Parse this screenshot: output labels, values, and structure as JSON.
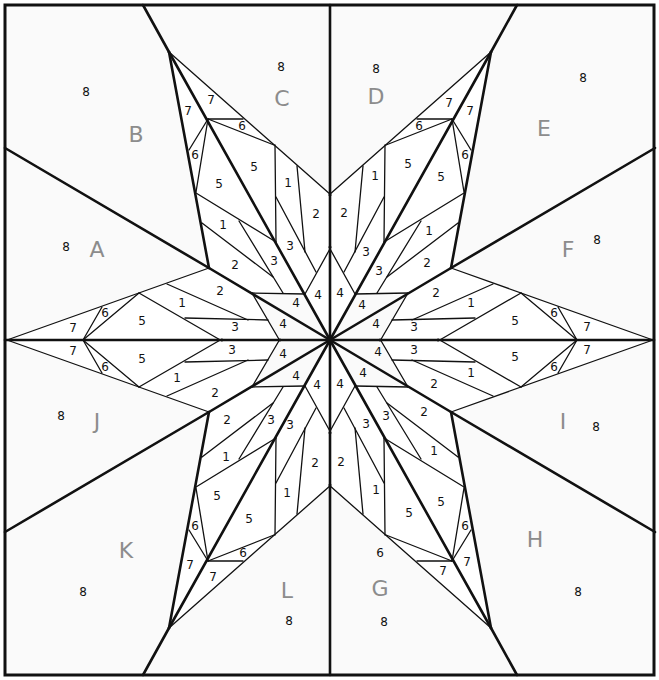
{
  "diagram": {
    "size": {
      "width": 659,
      "height": 680
    },
    "center": [
      330,
      340
    ],
    "colors": {
      "background": "#fafafa",
      "piece": "#ffffff",
      "line": "#111111",
      "section_letter": "#8c8c8c"
    },
    "section_letters": [
      {
        "text": "A",
        "x": 97,
        "y": 249
      },
      {
        "text": "B",
        "x": 136,
        "y": 134
      },
      {
        "text": "C",
        "x": 282,
        "y": 98
      },
      {
        "text": "D",
        "x": 376,
        "y": 96
      },
      {
        "text": "E",
        "x": 544,
        "y": 128
      },
      {
        "text": "F",
        "x": 568,
        "y": 249
      },
      {
        "text": "I",
        "x": 563,
        "y": 421
      },
      {
        "text": "H",
        "x": 535,
        "y": 539
      },
      {
        "text": "G",
        "x": 380,
        "y": 588
      },
      {
        "text": "L",
        "x": 287,
        "y": 590
      },
      {
        "text": "K",
        "x": 126,
        "y": 550
      },
      {
        "text": "J",
        "x": 97,
        "y": 421
      }
    ],
    "piece_numbers": [
      {
        "text": "8",
        "x": 86,
        "y": 92
      },
      {
        "text": "8",
        "x": 281,
        "y": 67
      },
      {
        "text": "8",
        "x": 376,
        "y": 69
      },
      {
        "text": "8",
        "x": 583,
        "y": 78
      },
      {
        "text": "8",
        "x": 66,
        "y": 247
      },
      {
        "text": "8",
        "x": 597,
        "y": 240
      },
      {
        "text": "8",
        "x": 61,
        "y": 416
      },
      {
        "text": "8",
        "x": 596,
        "y": 427
      },
      {
        "text": "8",
        "x": 83,
        "y": 592
      },
      {
        "text": "8",
        "x": 578,
        "y": 592
      },
      {
        "text": "8",
        "x": 289,
        "y": 621
      },
      {
        "text": "8",
        "x": 384,
        "y": 622
      },
      {
        "text": "7",
        "x": 211,
        "y": 100
      },
      {
        "text": "7",
        "x": 188,
        "y": 111
      },
      {
        "text": "6",
        "x": 242,
        "y": 126
      },
      {
        "text": "6",
        "x": 195,
        "y": 155
      },
      {
        "text": "5",
        "x": 254,
        "y": 167
      },
      {
        "text": "5",
        "x": 219,
        "y": 184
      },
      {
        "text": "1",
        "x": 288,
        "y": 183
      },
      {
        "text": "2",
        "x": 316,
        "y": 214
      },
      {
        "text": "1",
        "x": 223,
        "y": 225
      },
      {
        "text": "2",
        "x": 235,
        "y": 265
      },
      {
        "text": "3",
        "x": 290,
        "y": 246
      },
      {
        "text": "3",
        "x": 274,
        "y": 261
      },
      {
        "text": "4",
        "x": 318,
        "y": 295
      },
      {
        "text": "4",
        "x": 296,
        "y": 303
      },
      {
        "text": "2",
        "x": 220,
        "y": 291
      },
      {
        "text": "1",
        "x": 182,
        "y": 303
      },
      {
        "text": "5",
        "x": 142,
        "y": 321
      },
      {
        "text": "6",
        "x": 105,
        "y": 313
      },
      {
        "text": "7",
        "x": 73,
        "y": 328
      },
      {
        "text": "3",
        "x": 235,
        "y": 327
      },
      {
        "text": "4",
        "x": 283,
        "y": 324
      },
      {
        "text": "7",
        "x": 449,
        "y": 103
      },
      {
        "text": "7",
        "x": 470,
        "y": 111
      },
      {
        "text": "6",
        "x": 419,
        "y": 126
      },
      {
        "text": "6",
        "x": 465,
        "y": 155
      },
      {
        "text": "5",
        "x": 408,
        "y": 164
      },
      {
        "text": "5",
        "x": 441,
        "y": 177
      },
      {
        "text": "1",
        "x": 375,
        "y": 176
      },
      {
        "text": "2",
        "x": 344,
        "y": 213
      },
      {
        "text": "1",
        "x": 429,
        "y": 231
      },
      {
        "text": "2",
        "x": 427,
        "y": 263
      },
      {
        "text": "3",
        "x": 366,
        "y": 252
      },
      {
        "text": "3",
        "x": 379,
        "y": 271
      },
      {
        "text": "4",
        "x": 340,
        "y": 293
      },
      {
        "text": "4",
        "x": 362,
        "y": 305
      },
      {
        "text": "2",
        "x": 436,
        "y": 293
      },
      {
        "text": "1",
        "x": 471,
        "y": 303
      },
      {
        "text": "5",
        "x": 515,
        "y": 321
      },
      {
        "text": "6",
        "x": 554,
        "y": 313
      },
      {
        "text": "7",
        "x": 587,
        "y": 327
      },
      {
        "text": "3",
        "x": 414,
        "y": 327
      },
      {
        "text": "4",
        "x": 376,
        "y": 324
      },
      {
        "text": "7",
        "x": 73,
        "y": 351
      },
      {
        "text": "6",
        "x": 105,
        "y": 367
      },
      {
        "text": "5",
        "x": 142,
        "y": 359
      },
      {
        "text": "1",
        "x": 177,
        "y": 378
      },
      {
        "text": "2",
        "x": 215,
        "y": 393
      },
      {
        "text": "3",
        "x": 232,
        "y": 350
      },
      {
        "text": "4",
        "x": 283,
        "y": 354
      },
      {
        "text": "4",
        "x": 296,
        "y": 376
      },
      {
        "text": "4",
        "x": 317,
        "y": 385
      },
      {
        "text": "2",
        "x": 227,
        "y": 420
      },
      {
        "text": "1",
        "x": 226,
        "y": 457
      },
      {
        "text": "3",
        "x": 271,
        "y": 420
      },
      {
        "text": "3",
        "x": 290,
        "y": 425
      },
      {
        "text": "2",
        "x": 315,
        "y": 463
      },
      {
        "text": "1",
        "x": 287,
        "y": 493
      },
      {
        "text": "5",
        "x": 217,
        "y": 496
      },
      {
        "text": "5",
        "x": 249,
        "y": 519
      },
      {
        "text": "6",
        "x": 195,
        "y": 526
      },
      {
        "text": "6",
        "x": 243,
        "y": 553
      },
      {
        "text": "7",
        "x": 190,
        "y": 565
      },
      {
        "text": "7",
        "x": 213,
        "y": 577
      },
      {
        "text": "3",
        "x": 414,
        "y": 350
      },
      {
        "text": "4",
        "x": 378,
        "y": 352
      },
      {
        "text": "4",
        "x": 363,
        "y": 373
      },
      {
        "text": "4",
        "x": 340,
        "y": 384
      },
      {
        "text": "5",
        "x": 515,
        "y": 357
      },
      {
        "text": "6",
        "x": 554,
        "y": 367
      },
      {
        "text": "7",
        "x": 587,
        "y": 350
      },
      {
        "text": "1",
        "x": 471,
        "y": 373
      },
      {
        "text": "2",
        "x": 434,
        "y": 384
      },
      {
        "text": "2",
        "x": 424,
        "y": 412
      },
      {
        "text": "1",
        "x": 434,
        "y": 451
      },
      {
        "text": "3",
        "x": 386,
        "y": 416
      },
      {
        "text": "3",
        "x": 366,
        "y": 424
      },
      {
        "text": "2",
        "x": 341,
        "y": 462
      },
      {
        "text": "1",
        "x": 376,
        "y": 490
      },
      {
        "text": "5",
        "x": 441,
        "y": 502
      },
      {
        "text": "5",
        "x": 409,
        "y": 513
      },
      {
        "text": "6",
        "x": 465,
        "y": 526
      },
      {
        "text": "6",
        "x": 380,
        "y": 553
      },
      {
        "text": "7",
        "x": 467,
        "y": 562
      },
      {
        "text": "7",
        "x": 443,
        "y": 571
      }
    ]
  }
}
